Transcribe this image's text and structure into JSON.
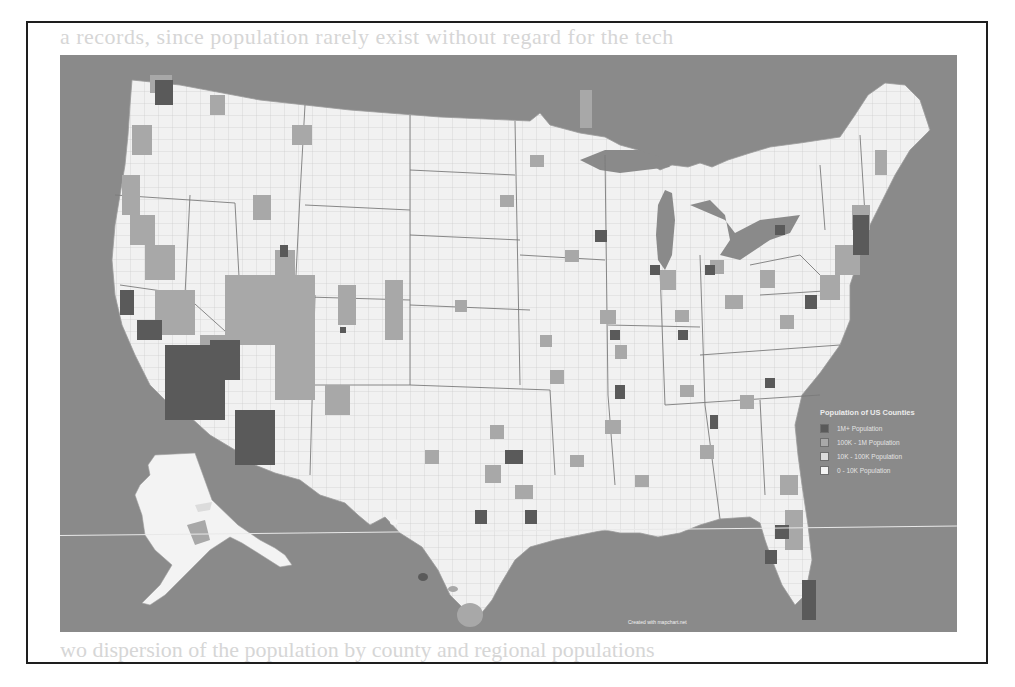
{
  "page": {
    "bleed_text_top": "a records, since population rarely exist without regard for the tech",
    "bleed_text_bottom": "wo dispersion of the population by county and regional populations"
  },
  "map": {
    "title": "Population of US Counties",
    "ocean_color": "#8a8a8a",
    "credit": "Created with mapchart.net",
    "legend": [
      {
        "label": "1M+ Population",
        "color": "#5a5a5a"
      },
      {
        "label": "100K - 1M Population",
        "color": "#a8a8a8"
      },
      {
        "label": "10K - 100K Population",
        "color": "#dcdcdc"
      },
      {
        "label": "0 - 10K Population",
        "color": "#f4f4f4"
      }
    ],
    "regions": [
      "Contiguous United States",
      "Alaska",
      "Hawaii"
    ]
  }
}
